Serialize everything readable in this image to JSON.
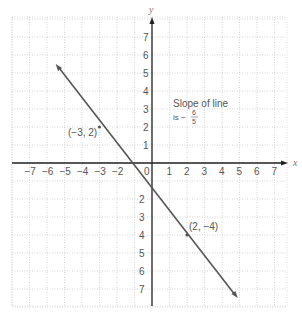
{
  "chart_data": {
    "type": "line",
    "title": "",
    "xlabel": "x",
    "ylabel": "y",
    "xlim": [
      -7,
      7
    ],
    "ylim": [
      -7,
      7
    ],
    "grid": true,
    "x_ticks": [
      "-7",
      "-6",
      "-5",
      "-4",
      "-3",
      "-2",
      "0",
      "1",
      "2",
      "3",
      "4",
      "5",
      "6",
      "7"
    ],
    "y_ticks": [
      "7",
      "6",
      "5",
      "4",
      "3",
      "2",
      "1",
      "-2",
      "-3",
      "-4",
      "-5",
      "-6",
      "-7"
    ],
    "series": [
      {
        "name": "line",
        "x": [
          -5.5,
          4.9
        ],
        "y": [
          5.5,
          -7.5
        ],
        "color": "#555555"
      }
    ],
    "points": [
      {
        "x": -3,
        "y": 2,
        "label": "(−3, 2)"
      },
      {
        "x": 2,
        "y": -4,
        "label": "(2, −4)"
      }
    ],
    "annotations": [
      {
        "line1": "Slope of line",
        "line2_prefix": "is −",
        "numerator": "6",
        "denominator": "5"
      }
    ]
  }
}
